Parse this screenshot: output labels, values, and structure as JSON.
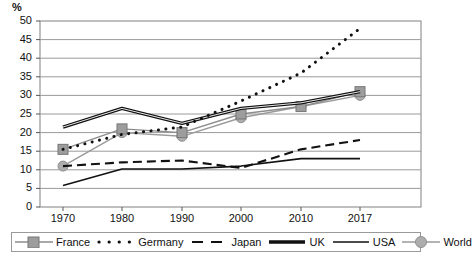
{
  "chart_data": {
    "type": "line",
    "title": "",
    "xlabel": "",
    "ylabel": "%",
    "ylim": [
      0,
      50
    ],
    "ytick_step": 5,
    "grid": true,
    "legend_position": "bottom",
    "categories": [
      "1970",
      "1980",
      "1990",
      "2000",
      "2010",
      "2017"
    ],
    "yticks": [
      "0",
      "5",
      "10",
      "15",
      "20",
      "25",
      "30",
      "35",
      "40",
      "45",
      "50"
    ],
    "series": [
      {
        "name": "France",
        "marker": "square",
        "style": "solid-gray",
        "color": "#8c8c8c",
        "values": [
          15.5,
          21.0,
          20.0,
          25.0,
          27.0,
          31.0
        ]
      },
      {
        "name": "Germany",
        "marker": "dot",
        "style": "dotted-black",
        "color": "#111111",
        "values": [
          15.5,
          19.5,
          21.5,
          28.5,
          36.0,
          48.0
        ]
      },
      {
        "name": "Japan",
        "marker": "none",
        "style": "dashed-black",
        "color": "#111111",
        "values": [
          11.0,
          12.0,
          12.5,
          10.5,
          15.5,
          18.0
        ]
      },
      {
        "name": "UK",
        "marker": "none",
        "style": "thick-black",
        "color": "#111111",
        "values": [
          21.5,
          26.5,
          22.5,
          26.5,
          28.0,
          31.0
        ]
      },
      {
        "name": "USA",
        "marker": "none",
        "style": "thin-black",
        "color": "#111111",
        "values": [
          5.8,
          10.2,
          10.2,
          11.0,
          13.0,
          13.0
        ]
      },
      {
        "name": "World",
        "marker": "circle",
        "style": "solid-gray",
        "color": "#a8a8a8",
        "values": [
          11.0,
          20.0,
          19.0,
          24.0,
          27.0,
          30.0
        ]
      }
    ]
  },
  "axis": {
    "unit_label": "%"
  },
  "legend": {
    "items": [
      {
        "label": "France"
      },
      {
        "label": "Germany"
      },
      {
        "label": "Japan"
      },
      {
        "label": "UK"
      },
      {
        "label": "USA"
      },
      {
        "label": "World"
      }
    ]
  }
}
